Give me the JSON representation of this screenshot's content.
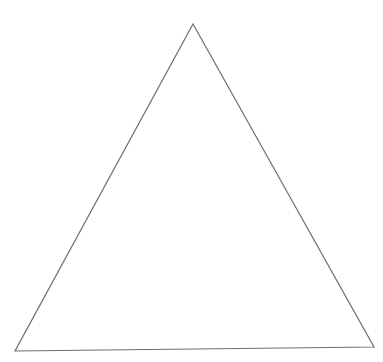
{
  "canvas": {
    "width": 383,
    "height": 362,
    "background": "#ffffff"
  },
  "shape": {
    "type": "triangle",
    "points": [
      [
        193,
        24
      ],
      [
        374,
        347
      ],
      [
        15,
        351
      ]
    ],
    "stroke": "#6e6e6e",
    "stroke_width": 1.2,
    "fill": "none"
  }
}
